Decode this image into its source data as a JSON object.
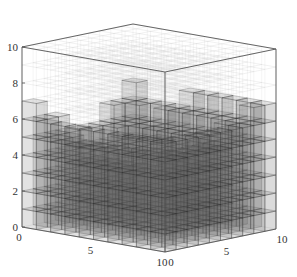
{
  "chart_data": {
    "type": "voxel3d",
    "title": "",
    "xlabel": "",
    "ylabel": "",
    "zlabel": "",
    "xlim": [
      0,
      10
    ],
    "ylim": [
      0,
      10
    ],
    "zlim": [
      0,
      10
    ],
    "x_ticks": [
      "0",
      "5",
      "10"
    ],
    "y_ticks": [
      "0",
      "5",
      "10"
    ],
    "z_ticks": [
      "0",
      "2",
      "4",
      "6",
      "8",
      "10"
    ],
    "grid": true,
    "height_map_columns_x_rows_y": [
      [
        7,
        6,
        6,
        5,
        5,
        5,
        5,
        6,
        6,
        7
      ],
      [
        6,
        5,
        5,
        4,
        4,
        4,
        5,
        5,
        6,
        6
      ],
      [
        6,
        5,
        4,
        4,
        3,
        3,
        4,
        5,
        5,
        6
      ],
      [
        6,
        5,
        4,
        3,
        3,
        3,
        4,
        5,
        6,
        6
      ],
      [
        6,
        5,
        4,
        3,
        2,
        3,
        4,
        5,
        6,
        7
      ],
      [
        6,
        5,
        4,
        3,
        3,
        3,
        4,
        5,
        6,
        7
      ],
      [
        6,
        5,
        4,
        4,
        3,
        4,
        4,
        5,
        6,
        7
      ],
      [
        6,
        5,
        5,
        4,
        4,
        4,
        5,
        5,
        6,
        7
      ],
      [
        6,
        6,
        5,
        5,
        5,
        5,
        5,
        6,
        6,
        7
      ],
      [
        6,
        6,
        6,
        6,
        6,
        6,
        6,
        6,
        7,
        7
      ]
    ],
    "voxel_color": "#5a5a5a",
    "voxel_opacity": 0.22,
    "edge_color": "#222222",
    "empty_grid_color": "#9a9a9a"
  },
  "figure": {
    "width": 297,
    "height": 277,
    "background": "#ffffff"
  }
}
